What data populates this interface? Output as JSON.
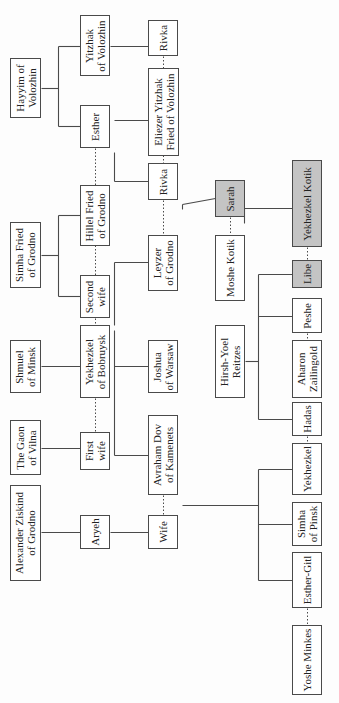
{
  "diagram": {
    "type": "family-tree",
    "orientation": "rotated-90-ccw",
    "colors": {
      "line": "#4a4a4a",
      "box_fill": "#ffffff",
      "highlight_fill": "#c4c4c4"
    },
    "people": [
      {
        "id": "hayyim",
        "label": "Hayyim of\nVolozhin",
        "x": 10,
        "y": 58,
        "w": 31,
        "h": 60,
        "highlight": false
      },
      {
        "id": "yitzhak",
        "label": "Yitzhak\nof Volozhin",
        "x": 80,
        "y": 15,
        "w": 30,
        "h": 61,
        "highlight": false
      },
      {
        "id": "esther",
        "label": "Esther",
        "x": 80,
        "y": 105,
        "w": 30,
        "h": 43,
        "highlight": false
      },
      {
        "id": "rivka1",
        "label": "Rivka",
        "x": 148,
        "y": 20,
        "w": 30,
        "h": 36,
        "highlight": false
      },
      {
        "id": "eliezer",
        "label": "Eliezer Yitzhak\nFried of Volozhin",
        "x": 148,
        "y": 68,
        "w": 31,
        "h": 88,
        "highlight": false
      },
      {
        "id": "rivka2",
        "label": "Rivka",
        "x": 148,
        "y": 163,
        "w": 30,
        "h": 37,
        "highlight": false
      },
      {
        "id": "simha_fried",
        "label": "Simha Fried\nof Grodno",
        "x": 10,
        "y": 222,
        "w": 31,
        "h": 66,
        "highlight": false
      },
      {
        "id": "hillel",
        "label": "Hillel Fried\nof Grodno",
        "x": 80,
        "y": 185,
        "w": 30,
        "h": 61,
        "highlight": false
      },
      {
        "id": "second_wife",
        "label": "Second\nwife",
        "x": 80,
        "y": 275,
        "w": 30,
        "h": 43,
        "highlight": false
      },
      {
        "id": "leyzer",
        "label": "Leyzer\nof Grodno",
        "x": 148,
        "y": 235,
        "w": 30,
        "h": 56,
        "highlight": false
      },
      {
        "id": "sarah",
        "label": "Sarah",
        "x": 215,
        "y": 180,
        "w": 30,
        "h": 37,
        "highlight": true
      },
      {
        "id": "moshe",
        "label": "Moshe Kotik",
        "x": 215,
        "y": 235,
        "w": 30,
        "h": 66,
        "highlight": false
      },
      {
        "id": "yekhezkel_kotik",
        "label": "Yekhezkel Kotik",
        "x": 292,
        "y": 160,
        "w": 30,
        "h": 87,
        "highlight": true
      },
      {
        "id": "libe",
        "label": "Libe",
        "x": 292,
        "y": 260,
        "w": 30,
        "h": 28,
        "highlight": true
      },
      {
        "id": "peshe",
        "label": "Peshe",
        "x": 292,
        "y": 298,
        "w": 30,
        "h": 35,
        "highlight": false
      },
      {
        "id": "aharon",
        "label": "Aharon\nZailingold",
        "x": 292,
        "y": 340,
        "w": 30,
        "h": 58,
        "highlight": false
      },
      {
        "id": "hadas",
        "label": "Hadas",
        "x": 292,
        "y": 402,
        "w": 30,
        "h": 34,
        "highlight": false
      },
      {
        "id": "yekhezkel",
        "label": "Yekhezkel",
        "x": 292,
        "y": 443,
        "w": 30,
        "h": 52,
        "highlight": false
      },
      {
        "id": "simha_pinsk",
        "label": "Simha\nof Pinsk",
        "x": 292,
        "y": 502,
        "w": 30,
        "h": 44,
        "highlight": false
      },
      {
        "id": "esther_gitl",
        "label": "Esther-Gitl",
        "x": 292,
        "y": 552,
        "w": 30,
        "h": 56,
        "highlight": false
      },
      {
        "id": "yoshe",
        "label": "Yoshe Minkes",
        "x": 292,
        "y": 625,
        "w": 30,
        "h": 70,
        "highlight": false
      },
      {
        "id": "hirsh",
        "label": "Hirsh-Yoel\nReitzes",
        "x": 215,
        "y": 325,
        "w": 30,
        "h": 73,
        "highlight": false
      },
      {
        "id": "shmuel",
        "label": "Shmuel\nof Minsk",
        "x": 10,
        "y": 340,
        "w": 31,
        "h": 53,
        "highlight": false
      },
      {
        "id": "yekhezkel_bobruysk",
        "label": "Yekhezkel\nof Bobruysk",
        "x": 80,
        "y": 325,
        "w": 30,
        "h": 73,
        "highlight": false
      },
      {
        "id": "joshua",
        "label": "Joshua\nof Warsaw",
        "x": 148,
        "y": 340,
        "w": 30,
        "h": 53,
        "highlight": false
      },
      {
        "id": "gaon",
        "label": "The Gaon\nof Vilna",
        "x": 10,
        "y": 420,
        "w": 31,
        "h": 55,
        "highlight": false
      },
      {
        "id": "first_wife",
        "label": "First\nwife",
        "x": 80,
        "y": 432,
        "w": 30,
        "h": 38,
        "highlight": false
      },
      {
        "id": "avraham",
        "label": "Avraham Dov\nof Kamenets",
        "x": 148,
        "y": 415,
        "w": 30,
        "h": 80,
        "highlight": false
      },
      {
        "id": "alexander",
        "label": "Alexander Ziskind\nof Grodno",
        "x": 10,
        "y": 485,
        "w": 31,
        "h": 96,
        "highlight": false
      },
      {
        "id": "aryeh",
        "label": "Aryeh",
        "x": 80,
        "y": 515,
        "w": 30,
        "h": 34,
        "highlight": false
      },
      {
        "id": "wife",
        "label": "Wife",
        "x": 148,
        "y": 515,
        "w": 30,
        "h": 34,
        "highlight": false
      }
    ],
    "lines": {
      "solid": [
        [
          41,
          88,
          58,
          88
        ],
        [
          58,
          46,
          58,
          126
        ],
        [
          58,
          46,
          80,
          46
        ],
        [
          58,
          126,
          80,
          126
        ],
        [
          110,
          46,
          148,
          46
        ],
        [
          114,
          152,
          114,
          181
        ],
        [
          114,
          120,
          148,
          120
        ],
        [
          114,
          181,
          148,
          181
        ],
        [
          41,
          255,
          58,
          255
        ],
        [
          58,
          215,
          58,
          296
        ],
        [
          58,
          215,
          80,
          215
        ],
        [
          58,
          296,
          80,
          296
        ],
        [
          114,
          262,
          114,
          325
        ],
        [
          114,
          262,
          148,
          262
        ],
        [
          182,
          209,
          182,
          204
        ],
        [
          182,
          204,
          215,
          198
        ],
        [
          244,
          208,
          292,
          208
        ],
        [
          244,
          208,
          244,
          223
        ],
        [
          41,
          366,
          80,
          366
        ],
        [
          114,
          366,
          148,
          366
        ],
        [
          114,
          330,
          114,
          455
        ],
        [
          114,
          455,
          148,
          455
        ],
        [
          245,
          361,
          258,
          361
        ],
        [
          258,
          274,
          258,
          419
        ],
        [
          258,
          274,
          292,
          274
        ],
        [
          258,
          316,
          292,
          316
        ],
        [
          258,
          419,
          292,
          419
        ],
        [
          41,
          448,
          80,
          448
        ],
        [
          41,
          532,
          80,
          532
        ],
        [
          110,
          532,
          148,
          532
        ],
        [
          182,
          505,
          258,
          505
        ],
        [
          258,
          469,
          258,
          580
        ],
        [
          258,
          469,
          292,
          469
        ],
        [
          258,
          524,
          292,
          524
        ],
        [
          258,
          580,
          292,
          580
        ]
      ],
      "dotted": [
        [
          95,
          148,
          95,
          185
        ],
        [
          163,
          56,
          163,
          68
        ],
        [
          163,
          155,
          163,
          163
        ],
        [
          95,
          245,
          95,
          275
        ],
        [
          163,
          200,
          163,
          235
        ],
        [
          230,
          217,
          230,
          235
        ],
        [
          307,
          247,
          307,
          260
        ],
        [
          307,
          333,
          307,
          340
        ],
        [
          307,
          436,
          307,
          443
        ],
        [
          95,
          318,
          95,
          325
        ],
        [
          95,
          398,
          95,
          432
        ],
        [
          163,
          495,
          163,
          515
        ],
        [
          307,
          608,
          307,
          625
        ]
      ]
    }
  }
}
